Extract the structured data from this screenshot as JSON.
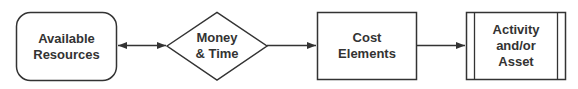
{
  "diagram": {
    "type": "flowchart",
    "direction": "left-to-right",
    "stroke_color": "#333333",
    "background": "#ffffff",
    "nodes": [
      {
        "id": "available-resources",
        "shape": "rounded-rectangle",
        "lines": [
          "Available",
          "Resources"
        ]
      },
      {
        "id": "money-time",
        "shape": "diamond",
        "lines": [
          "Money",
          "& Time"
        ]
      },
      {
        "id": "cost-elements",
        "shape": "rectangle",
        "lines": [
          "Cost",
          "Elements"
        ]
      },
      {
        "id": "activity-asset",
        "shape": "predefined-process",
        "lines": [
          "Activity",
          "and/or",
          "Asset"
        ]
      }
    ],
    "edges": [
      {
        "from": "available-resources",
        "to": "money-time",
        "bidirectional": true
      },
      {
        "from": "money-time",
        "to": "cost-elements",
        "bidirectional": false
      },
      {
        "from": "cost-elements",
        "to": "activity-asset",
        "bidirectional": false
      }
    ]
  }
}
